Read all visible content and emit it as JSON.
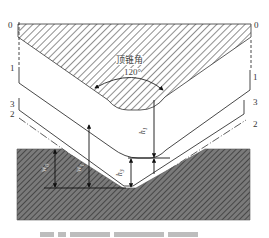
{
  "diagram": {
    "layer_labels": [
      {
        "id": "0",
        "text": "0"
      },
      {
        "id": "1",
        "text": "1"
      },
      {
        "id": "3",
        "text": "3"
      },
      {
        "id": "2",
        "text": "2"
      }
    ],
    "angle_annotation": {
      "label": "顶锥角",
      "value": "120°"
    },
    "dimensions": {
      "h1": {
        "main": "h",
        "sub": "1"
      },
      "h3": {
        "main": "h",
        "sub": "3"
      },
      "w0": {
        "main": "w",
        "sub": "0"
      },
      "w1": {
        "main": "w",
        "sub": "1"
      }
    },
    "colors": {
      "line": "#333333",
      "hatch_light_bg": "#ffffff",
      "hatch_dark_bg": "#6e6e6e",
      "hatch_dark_stripe": "#3a3a3a",
      "caption_grey": "#bdbdbd"
    }
  }
}
